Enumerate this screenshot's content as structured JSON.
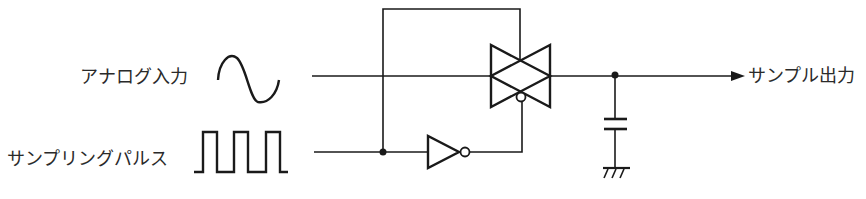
{
  "diagram": {
    "type": "sample-and-hold circuit (CMOS transmission gate)",
    "labels": {
      "analog_input": "アナログ入力",
      "sampling_pulse": "サンプリングパルス",
      "sample_output": "サンプル出力"
    },
    "components": [
      {
        "id": "analog-input-waveform",
        "kind": "sine-wave-icon"
      },
      {
        "id": "sampling-pulse-waveform",
        "kind": "square-wave-icon",
        "pulses": 3
      },
      {
        "id": "transmission-gate",
        "kind": "cmos-transmission-gate"
      },
      {
        "id": "inverter",
        "kind": "not-gate"
      },
      {
        "id": "hold-capacitor",
        "kind": "capacitor"
      },
      {
        "id": "ground",
        "kind": "ground"
      }
    ],
    "colors": {
      "line": "#1a1a1a",
      "text": "#2a2a2a",
      "background": "#ffffff"
    }
  }
}
